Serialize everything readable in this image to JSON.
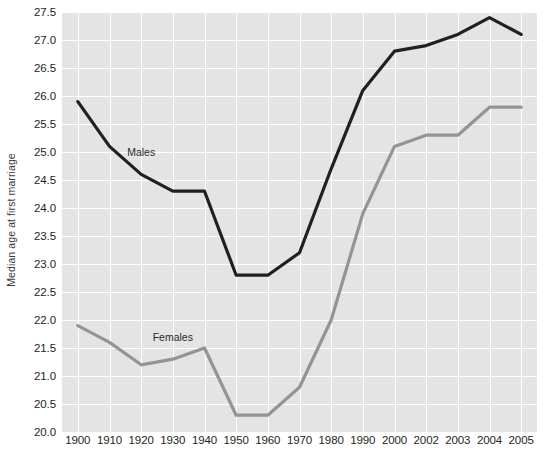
{
  "chart_data": {
    "type": "line",
    "title": "",
    "xlabel": "",
    "ylabel": "Median age at first marriage",
    "categories": [
      "1900",
      "1910",
      "1920",
      "1930",
      "1940",
      "1950",
      "1960",
      "1970",
      "1980",
      "1990",
      "2000",
      "2002",
      "2003",
      "2004",
      "2005"
    ],
    "ylim": [
      20.0,
      27.5
    ],
    "ytick_labels": [
      "27.5",
      "27.0",
      "26.5",
      "26.0",
      "25.5",
      "25.0",
      "24.5",
      "24.0",
      "23.5",
      "23.0",
      "22.5",
      "22.0",
      "21.5",
      "21.0",
      "20.5",
      "20.0"
    ],
    "ytick_values": [
      27.5,
      27.0,
      26.5,
      26.0,
      25.5,
      25.0,
      24.5,
      24.0,
      23.5,
      23.0,
      22.5,
      22.0,
      21.5,
      21.0,
      20.5,
      20.0
    ],
    "grid": true,
    "legend_position": "inline-annotations",
    "series": [
      {
        "name": "Males",
        "color": "#231f20",
        "label_x_category": "1920",
        "label_value": 25.0,
        "values": [
          25.9,
          25.1,
          24.6,
          24.3,
          24.3,
          22.8,
          22.8,
          23.2,
          24.7,
          26.1,
          26.8,
          26.9,
          27.1,
          27.4,
          27.1
        ]
      },
      {
        "name": "Females",
        "color": "#949494",
        "label_x_category": "1930",
        "label_value": 21.7,
        "values": [
          21.9,
          21.6,
          21.2,
          21.3,
          21.5,
          20.3,
          20.3,
          20.8,
          22.0,
          23.9,
          25.1,
          25.3,
          25.3,
          25.8,
          25.8
        ]
      }
    ]
  },
  "style": {
    "plot_background": "#e4e4e4",
    "gridline_color": "#ffffff",
    "page_background": "#ffffff",
    "males_color": "#231f20",
    "females_color": "#949494"
  }
}
